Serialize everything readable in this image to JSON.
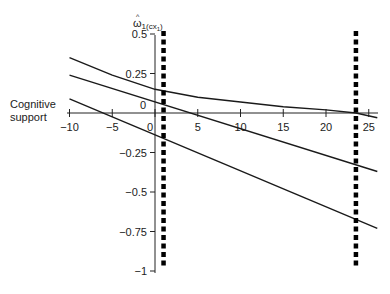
{
  "chart_data": {
    "type": "line",
    "title": "",
    "xlabel": "",
    "ylabel": "ω̂1(cx1)",
    "side_label": [
      "Cognitive",
      "support"
    ],
    "xlim": [
      -10,
      26
    ],
    "ylim": [
      -1,
      0.5
    ],
    "x_ticks": [
      -10,
      -5,
      0,
      5,
      10,
      15,
      20,
      25
    ],
    "x_tick_labels": [
      "−10",
      "−5",
      "0",
      "5",
      "10",
      "15",
      "20",
      "25"
    ],
    "y_ticks": [
      0.5,
      0.25,
      0,
      -0.25,
      -0.5,
      -0.75,
      -1
    ],
    "y_tick_labels": [
      "0.5",
      "0.25",
      "0",
      "−0.25",
      "−0.5",
      "−0.75",
      "−1"
    ],
    "grid": false,
    "legend": null,
    "series": [
      {
        "name": "upper",
        "x": [
          -10,
          -5,
          0,
          5,
          10,
          15,
          20,
          23.5,
          26
        ],
        "y": [
          0.35,
          0.24,
          0.15,
          0.1,
          0.07,
          0.04,
          0.02,
          0.0,
          -0.03
        ]
      },
      {
        "name": "middle",
        "x": [
          -10,
          26
        ],
        "y": [
          0.24,
          -0.37
        ]
      },
      {
        "name": "lower",
        "x": [
          -10,
          26
        ],
        "y": [
          0.09,
          -0.73
        ]
      }
    ],
    "vertical_markers": [
      {
        "x": 1,
        "style": "dashed-thick",
        "y_range": [
          -1,
          0.5
        ]
      },
      {
        "x": 23.5,
        "style": "dashed-thick",
        "y_range": [
          -1,
          0.5
        ]
      }
    ]
  }
}
